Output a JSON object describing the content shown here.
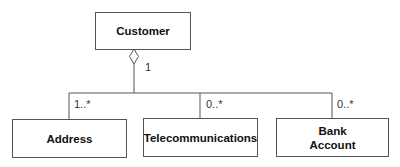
{
  "diagram": {
    "type": "uml-class-aggregation",
    "classes": [
      {
        "id": "customer",
        "name": "Customer"
      },
      {
        "id": "address",
        "name": "Address"
      },
      {
        "id": "telecom",
        "name": "Telecommunications"
      },
      {
        "id": "bank",
        "name": "Bank\nAccount",
        "line1": "Bank",
        "line2": "Account"
      }
    ],
    "relations": [
      {
        "from": "customer",
        "to": "address",
        "kind": "aggregation",
        "source_mult": "1",
        "target_mult": "1..*"
      },
      {
        "from": "customer",
        "to": "telecom",
        "kind": "aggregation",
        "source_mult": "1",
        "target_mult": "0..*"
      },
      {
        "from": "customer",
        "to": "bank",
        "kind": "aggregation",
        "source_mult": "1",
        "target_mult": "0..*"
      }
    ],
    "multiplicities": {
      "customer": "1",
      "address": "1..*",
      "telecom": "0..*",
      "bank": "0..*"
    },
    "colors": {
      "line": "#555555",
      "text": "#111111"
    }
  }
}
